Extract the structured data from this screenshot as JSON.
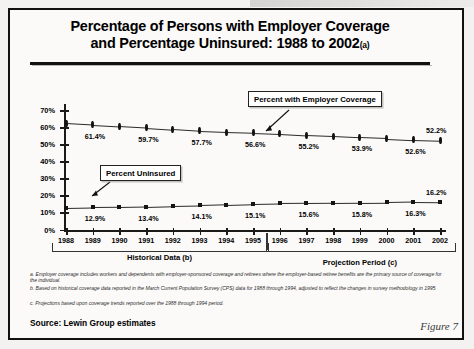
{
  "slide": {
    "title_line1": "Percentage of Persons with Employer Coverage",
    "title_line2": "and Percentage Uninsured:  1988 to 2002",
    "title_footnote_marker": "(a)",
    "source": "Source:  Lewin Group estimates",
    "figure_caption": "Figure 7"
  },
  "callouts": {
    "employer": "Percent with Employer Coverage",
    "uninsured": "Percent Uninsured"
  },
  "periods": {
    "historical": "Historical Data (b)",
    "projection": "Projection Period  (c)"
  },
  "footnotes": [
    {
      "marker": "a.",
      "text": "Employer coverage includes workers and dependents with employer-sponsored coverage and retirees where the employer-based retiree benefits are the primary source of coverage for the individual."
    },
    {
      "marker": "b.",
      "text": "Based on historical coverage data reported in the March Current Population Survey (CPS) data for 1988 through 1994, adjusted to reflect the changes in survey methodology in 1995."
    },
    {
      "marker": "c.",
      "text": "Projections based upon coverage trends reported over the 1988 through 1994 period."
    }
  ],
  "chart_data": {
    "type": "line",
    "title": "Percentage of Persons with Employer Coverage and Percentage Uninsured: 1988 to 2002",
    "xlabel": "",
    "ylabel": "",
    "ylim": [
      0,
      70
    ],
    "ytick_labels": [
      "0%",
      "10%",
      "20%",
      "30%",
      "40%",
      "50%",
      "60%",
      "70%"
    ],
    "ytick_values": [
      0,
      10,
      20,
      30,
      40,
      50,
      60,
      70
    ],
    "grid": false,
    "legend_position": "callout-annotations",
    "categories": [
      "1988",
      "1989",
      "1990",
      "1991",
      "1992",
      "1993",
      "1994",
      "1995",
      "1996",
      "1997",
      "1998",
      "1999",
      "2000",
      "2001",
      "2002"
    ],
    "series": [
      {
        "name": "Percent with Employer Coverage",
        "marker": "diamond",
        "values": [
          62.3,
          61.4,
          60.5,
          59.7,
          58.7,
          57.7,
          57.1,
          56.6,
          56.0,
          55.2,
          54.6,
          53.9,
          53.3,
          52.6,
          52.2
        ],
        "labels": [
          {
            "category": "1989",
            "text": "61.4%"
          },
          {
            "category": "1991",
            "text": "59.7%"
          },
          {
            "category": "1993",
            "text": "57.7%"
          },
          {
            "category": "1995",
            "text": "56.6%"
          },
          {
            "category": "1997",
            "text": "55.2%"
          },
          {
            "category": "1999",
            "text": "53.9%"
          },
          {
            "category": "2001",
            "text": "52.6%"
          },
          {
            "category": "2002",
            "text": "52.2%"
          }
        ]
      },
      {
        "name": "Percent Uninsured",
        "marker": "square",
        "values": [
          12.6,
          12.9,
          13.1,
          13.4,
          13.8,
          14.1,
          14.6,
          15.1,
          15.4,
          15.6,
          15.7,
          15.8,
          16.0,
          16.3,
          16.2
        ],
        "labels": [
          {
            "category": "1989",
            "text": "12.9%"
          },
          {
            "category": "1991",
            "text": "13.4%"
          },
          {
            "category": "1993",
            "text": "14.1%"
          },
          {
            "category": "1995",
            "text": "15.1%"
          },
          {
            "category": "1997",
            "text": "15.6%"
          },
          {
            "category": "1999",
            "text": "15.8%"
          },
          {
            "category": "2001",
            "text": "16.3%"
          },
          {
            "category": "2002",
            "text": "16.2%"
          }
        ]
      }
    ],
    "annotations": [
      {
        "text": "Historical Data (b)",
        "span": [
          "1988",
          "1995"
        ]
      },
      {
        "text": "Projection Period  (c)",
        "span": [
          "1996",
          "2002"
        ]
      }
    ]
  }
}
